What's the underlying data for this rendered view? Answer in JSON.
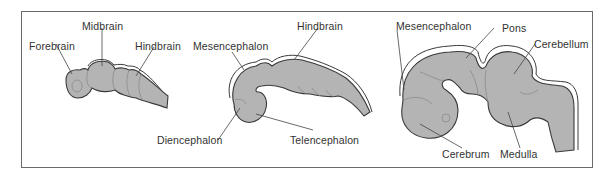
{
  "figure": {
    "colors": {
      "tissue_fill": "#b4b4b4",
      "outline": "#3a3a3a",
      "frame": "#6a6a6a",
      "label_text": "#333333"
    },
    "panels": [
      {
        "stage": "three-vesicle",
        "labels": [
          "Forebrain",
          "Midbrain",
          "Hindbrain"
        ]
      },
      {
        "stage": "five-vesicle",
        "labels": [
          "Mesencephalon",
          "Hindbrain",
          "Diencephalon",
          "Telencephalon"
        ]
      },
      {
        "stage": "mature",
        "labels": [
          "Mesencephalon",
          "Pons",
          "Cerebellum",
          "Cerebrum",
          "Medulla"
        ]
      }
    ]
  }
}
